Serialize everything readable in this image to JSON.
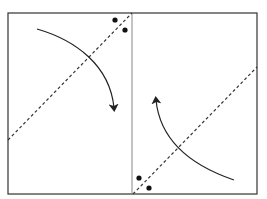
{
  "figure": {
    "label_fragment": "",
    "frame": {
      "x": 8,
      "y": 13,
      "width": 249,
      "height": 181,
      "stroke": "#333333"
    },
    "divider": {
      "x": 132,
      "stroke": "#888888"
    },
    "panels": [
      {
        "id": "left",
        "fold_line": {
          "x1": 8,
          "y1": 140,
          "x2": 132,
          "y2": 13,
          "style": "dashed"
        },
        "dots": [
          {
            "cx": 115,
            "cy": 20
          },
          {
            "cx": 125,
            "cy": 30
          }
        ],
        "arrow": {
          "path": "M37,29 C75,40 110,65 114,108",
          "direction": "clockwise-down",
          "head": {
            "x": 114,
            "y": 115
          }
        }
      },
      {
        "id": "right",
        "fold_line": {
          "x1": 133,
          "y1": 194,
          "x2": 257,
          "y2": 67,
          "style": "dashed"
        },
        "dots": [
          {
            "cx": 139,
            "cy": 178
          },
          {
            "cx": 149,
            "cy": 188
          }
        ],
        "arrow": {
          "path": "M234,180 C190,165 160,140 156,100",
          "direction": "counterclockwise-up",
          "head": {
            "x": 156,
            "y": 92
          }
        }
      }
    ],
    "colors": {
      "line": "#333333",
      "dash": "#333333",
      "dot": "#111111",
      "arrow": "#222222"
    }
  }
}
